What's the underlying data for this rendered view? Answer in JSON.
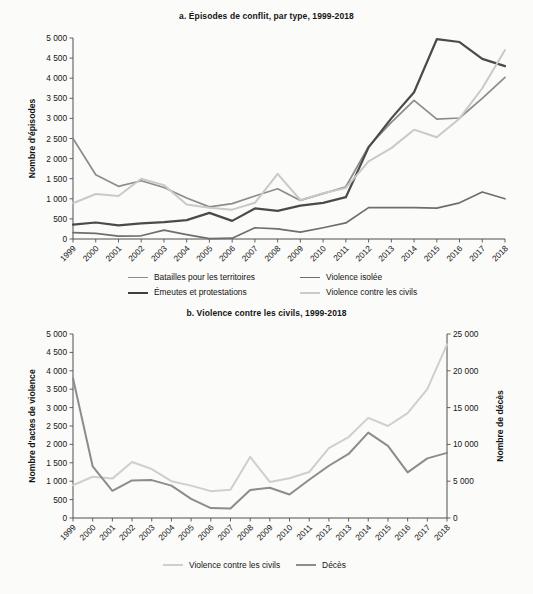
{
  "figure": {
    "background": "#fbfbfa"
  },
  "chart_data": [
    {
      "id": "panel-a",
      "type": "line",
      "title": "a. Épisodes de conflit, par type, 1999-2018",
      "xlabel": "",
      "ylabel": "Nombre d'épisodes",
      "grid": false,
      "legend_position": "bottom",
      "ylim": [
        0,
        5000
      ],
      "yticks": [
        0,
        500,
        1000,
        1500,
        2000,
        2500,
        3000,
        3500,
        4000,
        4500,
        5000
      ],
      "ytick_labels": [
        "0",
        "500",
        "1 000",
        "1 500",
        "2 000",
        "2 500",
        "3 000",
        "3 500",
        "4 000",
        "4 500",
        "5 000"
      ],
      "categories": [
        "1999",
        "2000",
        "2001",
        "2002",
        "2003",
        "2004",
        "2005",
        "2006",
        "2007",
        "2008",
        "2009",
        "2010",
        "2011",
        "2012",
        "2013",
        "2014",
        "2015",
        "2016",
        "2017",
        "2018"
      ],
      "series": [
        {
          "name": "Batailles pour les territoires",
          "color": "#8c8c8c",
          "width": 1.7,
          "values": [
            2500,
            1600,
            1310,
            1450,
            1280,
            1020,
            800,
            880,
            1070,
            1250,
            960,
            1130,
            1300,
            2300,
            2900,
            3450,
            2980,
            3010,
            3500,
            4020
          ]
        },
        {
          "name": "Violence isolée",
          "color": "#6e6e6e",
          "width": 1.7,
          "values": [
            160,
            140,
            70,
            80,
            220,
            110,
            10,
            20,
            280,
            250,
            170,
            280,
            400,
            780,
            780,
            780,
            770,
            900,
            1170,
            1000
          ]
        },
        {
          "name": "Émeutes et protestations",
          "color": "#4a4a4a",
          "width": 2.2,
          "values": [
            360,
            410,
            340,
            390,
            420,
            470,
            650,
            450,
            760,
            700,
            830,
            900,
            1040,
            2280,
            3000,
            3650,
            4970,
            4900,
            4480,
            4300
          ]
        },
        {
          "name": "Violence contre les civils",
          "color": "#c9c9c9",
          "width": 2.0,
          "values": [
            890,
            1120,
            1070,
            1500,
            1340,
            860,
            780,
            730,
            900,
            1620,
            970,
            1140,
            1270,
            1930,
            2260,
            2720,
            2530,
            3000,
            3750,
            4700
          ]
        }
      ]
    },
    {
      "id": "panel-b",
      "type": "line",
      "title": "b. Violence contre les civils, 1999-2018",
      "xlabel": "",
      "ylabel": "Nombre d'actes de violence",
      "ylabel_right": "Nombre de décès",
      "grid": false,
      "legend_position": "bottom",
      "ylim": [
        0,
        5000
      ],
      "yticks": [
        0,
        500,
        1000,
        1500,
        2000,
        2500,
        3000,
        3500,
        4000,
        4500,
        5000
      ],
      "ytick_labels": [
        "0",
        "500",
        "1 000",
        "1 500",
        "2 000",
        "2 500",
        "3 000",
        "3 500",
        "4 000",
        "4 500",
        "5 000"
      ],
      "ylim_right": [
        0,
        25000
      ],
      "yticks_right": [
        0,
        5000,
        10000,
        15000,
        20000,
        25000
      ],
      "ytick_labels_right": [
        "0",
        "5 000",
        "10 000",
        "15 000",
        "20 000",
        "25 000"
      ],
      "categories": [
        "1999",
        "2000",
        "2001",
        "2002",
        "2003",
        "2004",
        "2005",
        "2006",
        "2007",
        "2008",
        "2009",
        "2010",
        "2011",
        "2012",
        "2013",
        "2014",
        "2015",
        "2016",
        "2017",
        "2018"
      ],
      "series": [
        {
          "name": "Violence contre les civils",
          "axis": "left",
          "color": "#cfcfcf",
          "width": 2.0,
          "values": [
            890,
            1120,
            1070,
            1520,
            1330,
            1000,
            880,
            730,
            770,
            1660,
            980,
            1080,
            1250,
            1900,
            2200,
            2720,
            2500,
            2850,
            3500,
            4720
          ]
        },
        {
          "name": "Décès",
          "axis": "right",
          "color": "#8c8c8c",
          "width": 2.0,
          "values": [
            19000,
            7000,
            3700,
            5100,
            5150,
            4400,
            2600,
            1350,
            1300,
            3800,
            4100,
            3200,
            5200,
            7100,
            8700,
            11600,
            9800,
            6200,
            8100,
            8850
          ]
        }
      ]
    }
  ]
}
